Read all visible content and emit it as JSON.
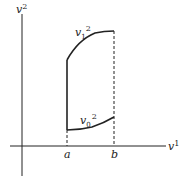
{
  "diagram": {
    "axes": {
      "horizontal_label": "v",
      "horizontal_superscript": "1",
      "vertical_label": "v",
      "vertical_superscript": "2"
    },
    "ticks": {
      "a": "a",
      "b": "b"
    },
    "curves": {
      "upper": {
        "label": "v",
        "subscript": "1",
        "superscript": "2"
      },
      "lower": {
        "label": "v",
        "subscript": "0",
        "superscript": "2"
      }
    },
    "colors": {
      "stroke": "#222222",
      "background": "#ffffff"
    }
  }
}
